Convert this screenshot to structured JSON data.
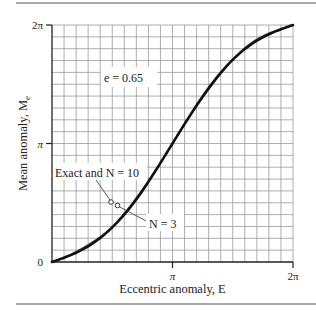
{
  "chart_data": {
    "type": "line",
    "title": "",
    "xlabel": "Eccentric anomaly, E",
    "ylabel": "Mean anomaly, M_e",
    "xlim": [
      0,
      6.2832
    ],
    "ylim": [
      0,
      6.2832
    ],
    "grid": true,
    "grid_divisions": {
      "x": 20,
      "y": 20
    },
    "x_ticks": [
      {
        "value": 0,
        "label": "0"
      },
      {
        "value": 3.1416,
        "label": "π"
      },
      {
        "value": 6.2832,
        "label": "2π"
      }
    ],
    "y_ticks": [
      {
        "value": 0,
        "label": "0"
      },
      {
        "value": 3.1416,
        "label": "π"
      },
      {
        "value": 6.2832,
        "label": "2π"
      }
    ],
    "series": [
      {
        "name": "Exact and N = 10",
        "equation": "M = E - e sin E",
        "x": [
          0,
          0.3142,
          0.6283,
          0.9425,
          1.2566,
          1.5708,
          1.885,
          2.1991,
          2.5133,
          2.8274,
          3.1416,
          3.4558,
          3.7699,
          4.0841,
          4.3982,
          4.7124,
          5.0265,
          5.3407,
          5.6549,
          5.969,
          6.2832
        ],
        "values": [
          0,
          0.113,
          0.246,
          0.424,
          0.638,
          0.921,
          1.267,
          1.817,
          2.131,
          2.627,
          3.142,
          3.657,
          4.152,
          4.466,
          5.016,
          5.362,
          5.645,
          5.859,
          6.037,
          6.17,
          6.283
        ]
      },
      {
        "name": "N = 3",
        "values_note": "nearly coincides with exact curve; visible as slight offset near E ≈ 1.0–1.2 and E ≈ 4.3–5.0"
      }
    ],
    "annotations": [
      {
        "text": "e = 0.65",
        "x": 1.9,
        "y": 5.2
      },
      {
        "text": "Exact and N = 10",
        "x": 0.9,
        "y": 2.0,
        "arrow_to": [
          1.48,
          1.02
        ]
      },
      {
        "text": "N = 3",
        "x": 2.55,
        "y": 0.55,
        "arrow_to": [
          1.65,
          0.85
        ]
      }
    ],
    "legend": null
  },
  "figure": {
    "e_label": "e = 0.65",
    "exact_label": "Exact and N = 10",
    "n3_label": "N = 3",
    "x_axis_label": "Eccentric anomaly, E",
    "y_axis_label": "Mean anomaly, M",
    "y_axis_sub": "e",
    "tick_0": "0",
    "tick_pi": "π",
    "tick_2pi": "2π",
    "colors": {
      "curve": "#111111",
      "grid": "#9a9a9a",
      "axis": "#222222",
      "rule": "#555555"
    }
  }
}
